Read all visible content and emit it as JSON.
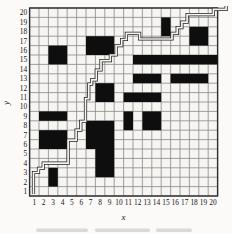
{
  "chart_data": {
    "type": "heatmap",
    "title": "",
    "xlabel": "x",
    "ylabel": "y",
    "x_ticks": [
      1,
      2,
      3,
      4,
      5,
      6,
      7,
      8,
      9,
      10,
      11,
      12,
      13,
      14,
      15,
      16,
      17,
      18,
      19,
      20
    ],
    "y_ticks": [
      1,
      2,
      3,
      4,
      5,
      6,
      7,
      8,
      9,
      10,
      11,
      12,
      13,
      14,
      15,
      16,
      17,
      18,
      19,
      20
    ],
    "grid": {
      "cols": 20,
      "rows": 20,
      "gridlines": "on"
    },
    "axis_ranges": {
      "x": [
        1,
        20
      ],
      "y": [
        1,
        20
      ]
    },
    "filled_blocks": [
      {
        "x": [
          2,
          4
        ],
        "y": [
          6,
          7
        ]
      },
      {
        "x": [
          2,
          4
        ],
        "y": [
          9,
          9
        ]
      },
      {
        "x": [
          3,
          3
        ],
        "y": [
          2,
          3
        ]
      },
      {
        "x": [
          3,
          4
        ],
        "y": [
          15,
          16
        ]
      },
      {
        "x": [
          7,
          9
        ],
        "y": [
          6,
          8
        ]
      },
      {
        "x": [
          7,
          9
        ],
        "y": [
          16,
          17
        ]
      },
      {
        "x": [
          8,
          9
        ],
        "y": [
          3,
          5
        ]
      },
      {
        "x": [
          8,
          9
        ],
        "y": [
          11,
          12
        ]
      },
      {
        "x": [
          11,
          11
        ],
        "y": [
          8,
          9
        ]
      },
      {
        "x": [
          13,
          14
        ],
        "y": [
          8,
          9
        ]
      },
      {
        "x": [
          11,
          14
        ],
        "y": [
          11,
          11
        ]
      },
      {
        "x": [
          12,
          14
        ],
        "y": [
          13,
          13
        ]
      },
      {
        "x": [
          16,
          19
        ],
        "y": [
          13,
          13
        ]
      },
      {
        "x": [
          12,
          20
        ],
        "y": [
          15,
          15
        ]
      },
      {
        "x": [
          15,
          15
        ],
        "y": [
          18,
          19
        ]
      },
      {
        "x": [
          18,
          19
        ],
        "y": [
          17,
          18
        ]
      }
    ],
    "staircase_path": [
      [
        0.42,
        0.2
      ],
      [
        0.42,
        2.5
      ],
      [
        0.95,
        2.5
      ],
      [
        0.95,
        2.95
      ],
      [
        1.45,
        2.95
      ],
      [
        1.45,
        3.5
      ],
      [
        4.1,
        3.5
      ],
      [
        4.1,
        5.95
      ],
      [
        4.95,
        5.95
      ],
      [
        4.95,
        7.0
      ],
      [
        5.45,
        7.0
      ],
      [
        5.45,
        7.95
      ],
      [
        5.95,
        7.95
      ],
      [
        5.95,
        10.35
      ],
      [
        6.3,
        10.35
      ],
      [
        6.3,
        11.9
      ],
      [
        6.6,
        11.9
      ],
      [
        6.6,
        12.35
      ],
      [
        7.1,
        12.35
      ],
      [
        7.1,
        13.4
      ],
      [
        7.6,
        13.4
      ],
      [
        7.6,
        14.4
      ],
      [
        8.6,
        14.4
      ],
      [
        8.6,
        15.0
      ],
      [
        9.2,
        15.0
      ],
      [
        9.2,
        16.0
      ],
      [
        9.8,
        16.0
      ],
      [
        9.8,
        16.65
      ],
      [
        10.3,
        16.65
      ],
      [
        10.3,
        17.3
      ],
      [
        11.7,
        17.3
      ],
      [
        11.7,
        16.7
      ],
      [
        15.15,
        16.7
      ],
      [
        15.15,
        17.3
      ],
      [
        15.7,
        17.3
      ],
      [
        15.7,
        17.9
      ],
      [
        16.2,
        17.9
      ],
      [
        16.2,
        18.5
      ],
      [
        16.75,
        18.5
      ],
      [
        16.75,
        19.3
      ],
      [
        19.55,
        19.3
      ],
      [
        19.55,
        19.85
      ],
      [
        20.9,
        19.85
      ],
      [
        20.9,
        20.2
      ]
    ],
    "path_style": "double-line staircase along cell boundaries, bottom-left to top-right",
    "colors": {
      "background": "#fbfaf8",
      "cell_background": "#f6f5f2",
      "grid_line": "#8f8f8f",
      "border": "#2e2e2e",
      "cell_fill": "#0e0e0e",
      "path": "#1f1f1f",
      "label": "#141414",
      "smudge": "#9a958d"
    },
    "caption_blur_segments": [
      [
        36,
        88
      ],
      [
        95,
        150
      ],
      [
        156,
        192
      ]
    ]
  }
}
